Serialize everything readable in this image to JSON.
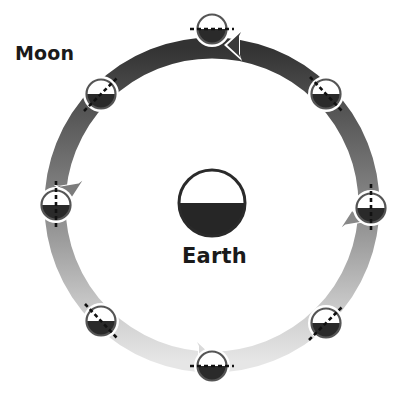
{
  "diagram": {
    "labels": {
      "moon": "Moon",
      "earth": "Earth"
    },
    "orbit": {
      "direction": "counterclockwise",
      "center": [
        212,
        205
      ],
      "radius": 157,
      "band_width": 20,
      "gradient": {
        "top": "#3a3a3a",
        "sides": "#8a8a8a",
        "bottom": "#e4e4e4"
      }
    },
    "earth": {
      "center": [
        212,
        203
      ],
      "radius": 34,
      "lit_color": "#ffffff",
      "dark_color": "#262626"
    },
    "moons": [
      {
        "position": "top",
        "angle_deg": 90,
        "axis": "horizontal"
      },
      {
        "position": "upper-left",
        "angle_deg": 135,
        "axis": "diagonal-up-right"
      },
      {
        "position": "left",
        "angle_deg": 180,
        "axis": "vertical"
      },
      {
        "position": "lower-left",
        "angle_deg": 225,
        "axis": "diagonal-down-right"
      },
      {
        "position": "bottom",
        "angle_deg": 270,
        "axis": "horizontal"
      },
      {
        "position": "lower-right",
        "angle_deg": 315,
        "axis": "diagonal-up-right"
      },
      {
        "position": "right",
        "angle_deg": 0,
        "axis": "vertical"
      },
      {
        "position": "upper-right",
        "angle_deg": 45,
        "axis": "diagonal-down-right"
      }
    ],
    "arrow_count": 4
  }
}
